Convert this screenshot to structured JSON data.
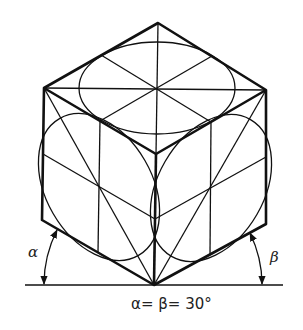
{
  "diagram": {
    "angle_label_left": "α",
    "angle_label_right": "β",
    "caption": "α= β= 30°",
    "colors": {
      "line": "#111111",
      "background": "#ffffff"
    }
  }
}
